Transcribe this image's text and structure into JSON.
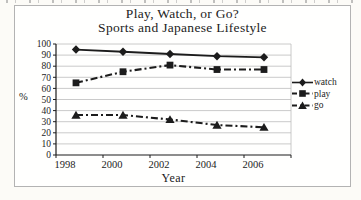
{
  "chart_data": {
    "type": "line",
    "title": "Play, Watch, or Go?",
    "subtitle": "Sports and Japanese Lifestyle",
    "xlabel": "Year",
    "ylabel": "%",
    "categories": [
      "1998",
      "2000",
      "2002",
      "2004",
      "2006"
    ],
    "yticks": [
      0,
      10,
      20,
      30,
      40,
      50,
      60,
      70,
      80,
      90,
      100
    ],
    "ylim": [
      0,
      100
    ],
    "grid": "horizontal",
    "legend_position": "right",
    "series": [
      {
        "name": "watch",
        "marker": "diamond",
        "line": "solid",
        "values": [
          95,
          93,
          91,
          89,
          88
        ]
      },
      {
        "name": "play",
        "marker": "square",
        "line": "dash-dot",
        "values": [
          65,
          75,
          81,
          77,
          77
        ]
      },
      {
        "name": "go",
        "marker": "triangle",
        "line": "dash-dot",
        "values": [
          36,
          36,
          32,
          27,
          25
        ]
      }
    ],
    "colors": {
      "line": "#1c1c1c",
      "grid": "#bdbdbd",
      "frame_border": "#b3b3b3",
      "background": "#ffffff"
    }
  }
}
